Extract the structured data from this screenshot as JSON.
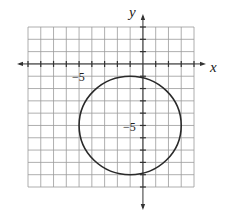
{
  "chart_data": {
    "type": "scatter",
    "title": "",
    "xlabel": "x",
    "ylabel": "y",
    "xlim": [
      -9,
      4
    ],
    "ylim": [
      -10,
      3
    ],
    "grid": true,
    "grid_step": 1,
    "tick_labels": {
      "x": [
        {
          "value": -5,
          "label": "−5"
        }
      ],
      "y": [
        {
          "value": -5,
          "label": "−5"
        }
      ]
    },
    "series": [
      {
        "name": "circle",
        "shape": "circle",
        "center": [
          -1,
          -5
        ],
        "radius": 4,
        "equation": "(x + 1)^2 + (y + 5)^2 = 16"
      }
    ]
  },
  "labels": {
    "x_axis": "x",
    "y_axis": "y",
    "x_tick": "−5",
    "y_tick": "−5"
  },
  "colors": {
    "grid": "#9a9a9a",
    "axis": "#333333",
    "curve": "#2a2a2a"
  }
}
